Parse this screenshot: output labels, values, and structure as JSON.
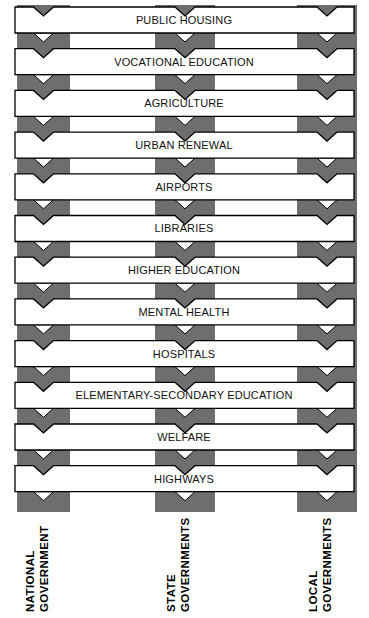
{
  "diagram": {
    "type": "interlocking-weave",
    "colors": {
      "band": "#6e6e6e",
      "bar_fill": "#ffffff",
      "outline": "#000000",
      "text": "#111111"
    },
    "columns": [
      {
        "id": "national",
        "label_line1": "NATIONAL",
        "label_line2": "GOVERNMENT",
        "x": 17,
        "width": 53
      },
      {
        "id": "state",
        "label_line1": "STATE",
        "label_line2": "GOVERNMENTS",
        "x": 155,
        "width": 60
      },
      {
        "id": "local",
        "label_line1": "LOCAL",
        "label_line2": "GOVERNMENTS",
        "x": 297,
        "width": 60
      }
    ],
    "bars": [
      {
        "label": "PUBLIC HOUSING"
      },
      {
        "label": "VOCATIONAL EDUCATION"
      },
      {
        "label": "AGRICULTURE"
      },
      {
        "label": "URBAN RENEWAL"
      },
      {
        "label": "AIRPORTS"
      },
      {
        "label": "LIBRARIES"
      },
      {
        "label": "HIGHER EDUCATION"
      },
      {
        "label": "MENTAL HEALTH"
      },
      {
        "label": "HOSPITALS"
      },
      {
        "label": "ELEMENTARY-SECONDARY EDUCATION"
      },
      {
        "label": "WELFARE"
      },
      {
        "label": "HIGHWAYS"
      }
    ]
  }
}
